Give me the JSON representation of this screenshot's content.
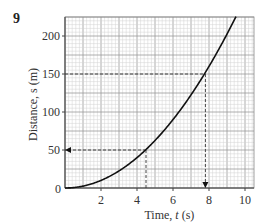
{
  "question_number": "9",
  "chart_data": {
    "type": "line",
    "title": "",
    "xlabel": "Time, t (s)",
    "ylabel": "Distance, s (m)",
    "xlim": [
      0,
      10.5
    ],
    "ylim": [
      0,
      225
    ],
    "x_ticks": [
      "0",
      "2",
      "4",
      "6",
      "8",
      "10"
    ],
    "y_ticks": [
      "0",
      "50",
      "100",
      "150",
      "200"
    ],
    "grid": true,
    "series": [
      {
        "name": "s = 2.5 t^2",
        "x": [
          0,
          1,
          2,
          3,
          4,
          4.5,
          5,
          6,
          7,
          7.8,
          8,
          9,
          9.5
        ],
        "values": [
          0,
          2.5,
          10,
          22.5,
          40,
          50,
          62.5,
          90,
          122.5,
          152,
          160,
          202.5,
          225
        ]
      }
    ],
    "annotations": [
      {
        "type": "dashed-arrow",
        "from": [
          4.5,
          50
        ],
        "to": [
          0,
          50
        ],
        "note": "reading s=50 m at t≈4.5 s"
      },
      {
        "type": "dashed-line",
        "from": [
          4.5,
          50
        ],
        "to": [
          4.5,
          0
        ]
      },
      {
        "type": "dashed-line",
        "from": [
          0,
          150
        ],
        "to": [
          7.8,
          150
        ]
      },
      {
        "type": "dashed-arrow",
        "from": [
          7.8,
          150
        ],
        "to": [
          7.8,
          0
        ],
        "note": "reading t≈7.8 s at s=150 m"
      }
    ]
  },
  "labels": {
    "x_axis": "Time, ",
    "x_axis_var": "t",
    "x_axis_unit": " (s)",
    "y_axis": "Distance, s (m)",
    "origin": "0"
  }
}
